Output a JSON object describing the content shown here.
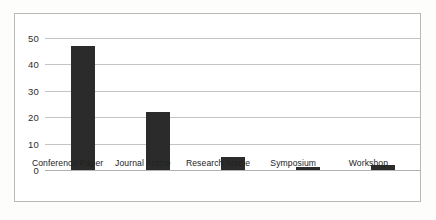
{
  "chart_data": {
    "type": "bar",
    "title": "",
    "subtitle": "",
    "xlabel": "",
    "ylabel": "",
    "categories": [
      "Conference Paper",
      "Journal Article",
      "Research Article",
      "Symposium",
      "Workshop"
    ],
    "values": [
      47,
      22,
      5,
      1,
      2
    ],
    "series": [
      {
        "name": "Publication count",
        "values": [
          47,
          22,
          5,
          1,
          2
        ]
      }
    ],
    "ylim": [
      0,
      50
    ],
    "yticks": [
      0,
      10,
      20,
      30,
      40,
      50
    ],
    "ytick_labels": [
      "0",
      "10",
      "20",
      "30",
      "40",
      "50"
    ],
    "grid": true,
    "grid_axis": "y",
    "legend": false,
    "legend_position": "none",
    "bar_color": "#2b2b2b",
    "grid_color": "#c4c4c4",
    "axis_color": "#b0b0b0",
    "frame_color": "#b9b9b9",
    "background_color": "#ffffff",
    "annotations": []
  }
}
